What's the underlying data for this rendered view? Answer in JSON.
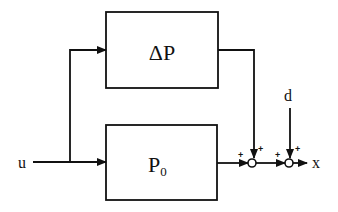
{
  "diagram": {
    "type": "block-diagram",
    "colors": {
      "ink": "#111111",
      "background": "#ffffff"
    },
    "blocks": [
      {
        "id": "delta_p",
        "label": "ΔP"
      },
      {
        "id": "p0",
        "label": "P",
        "subscript": "0"
      }
    ],
    "signals": {
      "input": "u",
      "disturbance": "d",
      "output": "x"
    },
    "summing_junctions": [
      {
        "id": "sum1",
        "signs": [
          "+",
          "+"
        ]
      },
      {
        "id": "sum2",
        "signs": [
          "+",
          "+"
        ]
      }
    ]
  }
}
